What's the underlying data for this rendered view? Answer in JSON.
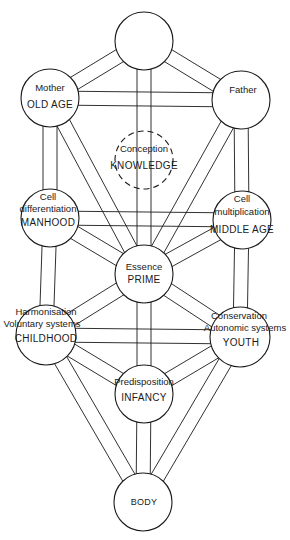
{
  "diagram": {
    "type": "tree-of-life",
    "stroke_color": "#1a1a1a",
    "background": "#ffffff",
    "nodes": [
      {
        "id": "crown",
        "cx": 144,
        "cy": 41,
        "r": 29,
        "sublabel": "",
        "label": "",
        "dashed": false
      },
      {
        "id": "mother",
        "cx": 50,
        "cy": 98,
        "r": 29,
        "sublabel": "Mother",
        "label": "OLD AGE",
        "dashed": false
      },
      {
        "id": "father",
        "cx": 241,
        "cy": 100,
        "r": 29,
        "sublabel": "Father",
        "label": "",
        "dashed": false
      },
      {
        "id": "knowledge",
        "cx": 144,
        "cy": 160,
        "r": 29,
        "sublabel": "Conception",
        "label": "KNOWLEDGE",
        "dashed": true
      },
      {
        "id": "manhood",
        "cx": 50,
        "cy": 218,
        "r": 29,
        "sublabel_lines": [
          "Cell",
          "differentiation"
        ],
        "label": "MANHOOD",
        "dashed": false
      },
      {
        "id": "middle_age",
        "cx": 242,
        "cy": 220,
        "r": 29,
        "sublabel_lines": [
          "Cell",
          "multiplication"
        ],
        "label": "MIDDLE AGE",
        "dashed": false
      },
      {
        "id": "prime",
        "cx": 144,
        "cy": 274,
        "r": 29,
        "sublabel": "Essence",
        "label": "PRIME",
        "dashed": false
      },
      {
        "id": "childhood",
        "cx": 46,
        "cy": 335,
        "r": 30,
        "sublabel_lines": [
          "Harmonisation",
          "Voluntary systems"
        ],
        "label": "CHILDHOOD",
        "dashed": false
      },
      {
        "id": "youth",
        "cx": 240,
        "cy": 337,
        "r": 30,
        "sublabel_lines": [
          "Conservation",
          "Autonomic systems"
        ],
        "label": "YOUTH",
        "dashed": false
      },
      {
        "id": "infancy",
        "cx": 144,
        "cy": 394,
        "r": 29,
        "sublabel": "Predisposition",
        "label": "INFANCY",
        "dashed": false
      },
      {
        "id": "body",
        "cx": 143,
        "cy": 502,
        "r": 29,
        "sublabel": "",
        "label": "BODY",
        "dashed": false
      }
    ],
    "labels": {
      "crown": "",
      "mother_sub": "Mother",
      "mother_main": "OLD AGE",
      "father_sub": "Father",
      "knowledge_sub": "Conception",
      "knowledge_main": "KNOWLEDGE",
      "manhood_sub1": "Cell",
      "manhood_sub2": "differentiation",
      "manhood_main": "MANHOOD",
      "middle_sub1": "Cell",
      "middle_sub2": "multiplication",
      "middle_main": "MIDDLE AGE",
      "prime_sub": "Essence",
      "prime_main": "PRIME",
      "childhood_sub1": "Harmonisation",
      "childhood_sub2": "Voluntary systems",
      "childhood_main": "CHILDHOOD",
      "youth_sub1": "Conservation",
      "youth_sub2": "Autonomic systems",
      "youth_main": "YOUTH",
      "infancy_sub": "Predisposition",
      "infancy_main": "INFANCY",
      "body_main": "BODY"
    },
    "paths": [
      [
        "crown",
        "mother"
      ],
      [
        "crown",
        "father"
      ],
      [
        "crown",
        "prime"
      ],
      [
        "mother",
        "father"
      ],
      [
        "mother",
        "manhood"
      ],
      [
        "mother",
        "prime"
      ],
      [
        "father",
        "middle_age"
      ],
      [
        "father",
        "prime"
      ],
      [
        "manhood",
        "middle_age"
      ],
      [
        "manhood",
        "prime"
      ],
      [
        "middle_age",
        "prime"
      ],
      [
        "manhood",
        "childhood"
      ],
      [
        "middle_age",
        "youth"
      ],
      [
        "prime",
        "childhood"
      ],
      [
        "prime",
        "youth"
      ],
      [
        "prime",
        "infancy"
      ],
      [
        "childhood",
        "youth"
      ],
      [
        "childhood",
        "infancy"
      ],
      [
        "youth",
        "infancy"
      ],
      [
        "childhood",
        "body"
      ],
      [
        "youth",
        "body"
      ],
      [
        "infancy",
        "body"
      ]
    ]
  }
}
